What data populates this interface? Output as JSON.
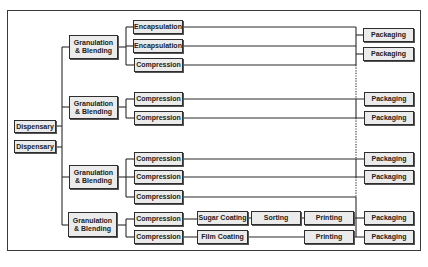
{
  "diagram": {
    "title": "",
    "nodes": [
      {
        "id": "disp1",
        "label": "Dispensary",
        "x": 14,
        "y": 120,
        "w": 42,
        "h": 13
      },
      {
        "id": "disp2",
        "label": "Dispensary",
        "x": 14,
        "y": 140,
        "w": 42,
        "h": 13
      },
      {
        "id": "gran1",
        "label": "Granulation\n& Blending",
        "x": 69,
        "y": 35,
        "w": 49,
        "h": 24
      },
      {
        "id": "gran2",
        "label": "Granulation\n& Blending",
        "x": 69,
        "y": 96,
        "w": 49,
        "h": 23
      },
      {
        "id": "gran3",
        "label": "Granulation\n& Blending",
        "x": 69,
        "y": 165,
        "w": 49,
        "h": 24
      },
      {
        "id": "gran4",
        "label": "Granulation\n& Blending",
        "x": 68,
        "y": 212,
        "w": 49,
        "h": 25
      },
      {
        "id": "enc1",
        "label": "Encapsulation",
        "x": 133,
        "y": 20,
        "w": 50,
        "h": 14
      },
      {
        "id": "enc2",
        "label": "Encapsulation",
        "x": 133,
        "y": 39,
        "w": 50,
        "h": 14
      },
      {
        "id": "comp1",
        "label": "Compression",
        "x": 134,
        "y": 58,
        "w": 49,
        "h": 14
      },
      {
        "id": "comp2",
        "label": "Compression",
        "x": 134,
        "y": 92,
        "w": 49,
        "h": 14
      },
      {
        "id": "comp3",
        "label": "Compression",
        "x": 134,
        "y": 111,
        "w": 49,
        "h": 14
      },
      {
        "id": "comp4",
        "label": "Compression",
        "x": 134,
        "y": 152,
        "w": 49,
        "h": 14
      },
      {
        "id": "comp5",
        "label": "Compression",
        "x": 134,
        "y": 170,
        "w": 49,
        "h": 14
      },
      {
        "id": "comp6",
        "label": "Compression",
        "x": 134,
        "y": 190,
        "w": 49,
        "h": 14
      },
      {
        "id": "comp7",
        "label": "Compression",
        "x": 134,
        "y": 212,
        "w": 49,
        "h": 14
      },
      {
        "id": "comp8",
        "label": "Compression",
        "x": 134,
        "y": 230,
        "w": 49,
        "h": 14
      },
      {
        "id": "sugar",
        "label": "Sugar Coating",
        "x": 197,
        "y": 211,
        "w": 51,
        "h": 14
      },
      {
        "id": "sort",
        "label": "Sorting",
        "x": 251,
        "y": 211,
        "w": 50,
        "h": 14
      },
      {
        "id": "print1",
        "label": "Printing",
        "x": 304,
        "y": 211,
        "w": 50,
        "h": 14
      },
      {
        "id": "film",
        "label": "Film Coating",
        "x": 197,
        "y": 230,
        "w": 51,
        "h": 14
      },
      {
        "id": "print2",
        "label": "Printing",
        "x": 304,
        "y": 230,
        "w": 50,
        "h": 14
      },
      {
        "id": "pack1",
        "label": "Packaging",
        "x": 363,
        "y": 28,
        "w": 51,
        "h": 14
      },
      {
        "id": "pack2",
        "label": "Packaging",
        "x": 363,
        "y": 47,
        "w": 51,
        "h": 14
      },
      {
        "id": "pack3",
        "label": "Packaging",
        "x": 364,
        "y": 92,
        "w": 50,
        "h": 14
      },
      {
        "id": "pack4",
        "label": "Packaging",
        "x": 364,
        "y": 111,
        "w": 50,
        "h": 14
      },
      {
        "id": "pack5",
        "label": "Packaging",
        "x": 364,
        "y": 152,
        "w": 50,
        "h": 14
      },
      {
        "id": "pack6",
        "label": "Packaging",
        "x": 364,
        "y": 170,
        "w": 50,
        "h": 14
      },
      {
        "id": "pack7",
        "label": "Packaging",
        "x": 364,
        "y": 211,
        "w": 50,
        "h": 14
      },
      {
        "id": "pack8",
        "label": "Packaging",
        "x": 364,
        "y": 230,
        "w": 50,
        "h": 14
      }
    ],
    "lines": [
      "M56 126 H62",
      "M56 147 H62",
      "M62 47 V225",
      "M62 47 H69",
      "M62 107 H69",
      "M62 177 H69",
      "M62 225 H68",
      "M118 47 H126",
      "M126 27 V65",
      "M126 27 H133",
      "M126 46 H133",
      "M126 65 H134",
      "M118 107 H126",
      "M126 99 V118",
      "M126 99 H134",
      "M126 118 H134",
      "M118 177 H126",
      "M126 159 V197",
      "M126 159 H134",
      "M126 177 H134",
      "M126 197 H134",
      "M117 225 H126",
      "M126 219 V237",
      "M126 219 H134",
      "M126 237 H134",
      "M183 27 H356",
      "M183 46 H356",
      "M183 65 H356",
      "M356 27 V65",
      "M356 35 H363",
      "M356 54 H363",
      "M183 99 H364",
      "M183 118 H364",
      "M356 99 V118",
      "M183 159 H364",
      "M183 177 H364",
      "M356 159 V177",
      "M183 197 H356",
      "M356 197 V237",
      "M183 219 H197",
      "M248 218 H251",
      "M301 218 H304",
      "M354 218 H364",
      "M183 237 H197",
      "M248 237 H304",
      "M354 237 H364"
    ],
    "dotted_lines": [
      "M356 65 V99",
      "M356 118 V159",
      "M356 177 V197"
    ]
  }
}
